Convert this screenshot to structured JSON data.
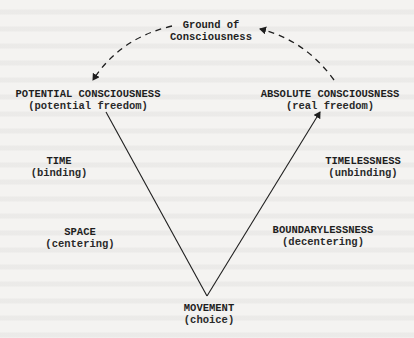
{
  "diagram": {
    "top": {
      "line1": "Ground of",
      "line2": "Consciousness"
    },
    "left_top": {
      "title": "POTENTIAL CONSCIOUSNESS",
      "subtitle": "(potential freedom)"
    },
    "right_top": {
      "title": "ABSOLUTE CONSCIOUSNESS",
      "subtitle": "(real freedom)"
    },
    "left_mid": {
      "title": "TIME",
      "subtitle": "(binding)"
    },
    "left_low": {
      "title": "SPACE",
      "subtitle": "(centering)"
    },
    "right_mid": {
      "title": "TIMELESSNESS",
      "subtitle": "(unbinding)"
    },
    "right_low": {
      "title": "BOUNDARYLESSNESS",
      "subtitle": "(decentering)"
    },
    "bottom": {
      "title": "MOVEMENT",
      "subtitle": "(choice)"
    },
    "colors": {
      "ink": "#1e1e1e",
      "paper": "#f4f3f1"
    }
  }
}
